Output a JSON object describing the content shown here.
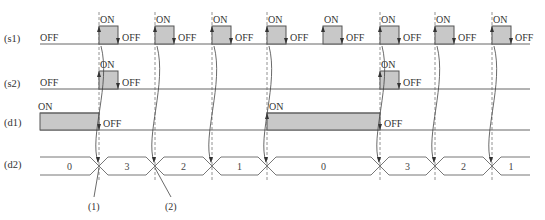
{
  "diagram": {
    "type": "timing-diagram",
    "rows": [
      {
        "id": "s1",
        "label": "(s1)",
        "y": 44,
        "high": 26
      },
      {
        "id": "s2",
        "label": "(s2)",
        "y": 89,
        "high": 71
      },
      {
        "id": "d1",
        "label": "(d1)",
        "y": 130,
        "high": 113
      },
      {
        "id": "d2",
        "label": "(d2)",
        "top": 157,
        "bottom": 175
      }
    ],
    "texts": {
      "on": "ON",
      "off": "OFF"
    },
    "s1_pulses": [
      99,
      155,
      212,
      267,
      323,
      380,
      435,
      492
    ],
    "pulse_width": 19,
    "s2_pulses": [
      99,
      380
    ],
    "d1_on_ranges": [
      [
        40,
        99
      ],
      [
        267,
        380
      ]
    ],
    "dashed_lines": [
      99,
      155,
      212,
      267,
      380,
      435,
      492
    ],
    "d2_segments": [
      {
        "value": "0",
        "x1": 40,
        "x2": 99
      },
      {
        "value": "3",
        "x1": 99,
        "x2": 155
      },
      {
        "value": "2",
        "x1": 155,
        "x2": 212
      },
      {
        "value": "1",
        "x1": 212,
        "x2": 267
      },
      {
        "value": "0",
        "x1": 267,
        "x2": 380
      },
      {
        "value": "3",
        "x1": 380,
        "x2": 435
      },
      {
        "value": "2",
        "x1": 435,
        "x2": 492
      },
      {
        "value": "1",
        "x1": 492,
        "x2": 530
      }
    ],
    "callouts": [
      {
        "label": "(1)",
        "x": 88,
        "from_x": 99
      },
      {
        "label": "(2)",
        "x": 165,
        "from_x": 155
      }
    ]
  }
}
